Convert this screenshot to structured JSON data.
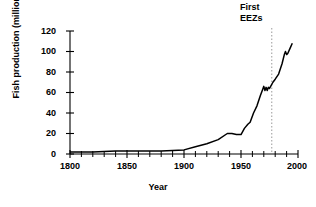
{
  "chart_data": {
    "type": "line",
    "title": "",
    "xlabel": "Year",
    "ylabel": "Fish production (million t)",
    "xlim": [
      1800,
      2000
    ],
    "ylim": [
      0,
      120
    ],
    "xticks": [
      1800,
      1850,
      1900,
      1950,
      2000
    ],
    "xtick_labels": [
      "1800",
      "1850",
      "1900",
      "1950",
      "2000"
    ],
    "x_minor_tick_interval": 10,
    "yticks": [
      0,
      20,
      40,
      60,
      80,
      100,
      120
    ],
    "ytick_labels": [
      "0",
      "20",
      "40",
      "60",
      "80",
      "100",
      "120"
    ],
    "grid": false,
    "legend": false,
    "series": [
      {
        "name": "World fish production",
        "x": [
          1800,
          1820,
          1840,
          1860,
          1880,
          1900,
          1910,
          1920,
          1930,
          1938,
          1942,
          1946,
          1950,
          1953,
          1956,
          1958,
          1961,
          1964,
          1967,
          1969,
          1970,
          1971,
          1972,
          1973,
          1974,
          1975,
          1976,
          1978,
          1980,
          1983,
          1986,
          1988,
          1989,
          1990,
          1991,
          1993,
          1995
        ],
        "values": [
          2,
          2,
          3,
          3,
          3,
          4,
          7,
          10,
          14,
          20,
          20,
          19,
          19,
          25,
          29,
          31,
          40,
          47,
          57,
          63,
          66,
          62,
          65,
          62,
          65,
          64,
          66,
          70,
          73,
          78,
          88,
          97,
          100,
          97,
          98,
          103,
          108
        ]
      }
    ],
    "annotations": [
      {
        "name": "first-eezs",
        "text_lines": [
          "First",
          "EEZs"
        ],
        "x": 1977,
        "marker": "dashed-vertical-line"
      }
    ],
    "colors": {
      "line": "#000000",
      "axis": "#000000",
      "annotation_line": "#888888",
      "background": "#ffffff"
    }
  }
}
